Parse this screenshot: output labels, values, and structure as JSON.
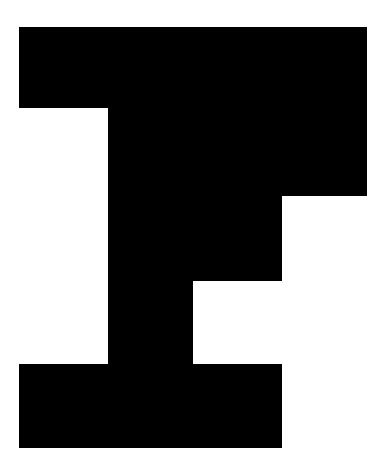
{
  "image": {
    "kind": "letterform-glyph",
    "description": "Bold slab-serif capital letter glyph rendered as a solid black silhouette on a plain white background",
    "character": "F",
    "alt_text": "Large black capital letter F",
    "width": 389,
    "height": 473
  },
  "colors": {
    "background": "#ffffff",
    "glyph": "#000000",
    "counter": "#ffffff"
  },
  "glyph": {
    "name": "capital-f",
    "label": "F",
    "fill": "#000000",
    "outline_path": "M 19 27 L 367 27 L 367 196 L 282 196 L 282 281 L 193 281 L 193 364 L 282 364 L 282 448 L 19 448 L 19 364 L 108 364 L 108 108 L 19 108 Z",
    "subshapes": [
      {
        "name": "top-bar",
        "role": "upper horizontal arm",
        "x": 19,
        "y": 27,
        "width": 348,
        "height": 81
      },
      {
        "name": "top-right-block",
        "role": "upper-right terminal block below top bar",
        "x": 281,
        "y": 108,
        "width": 86,
        "height": 88
      },
      {
        "name": "stem",
        "role": "vertical stroke",
        "x": 108,
        "y": 27,
        "width": 85,
        "height": 337
      },
      {
        "name": "middle-arm",
        "role": "middle horizontal arm",
        "x": 193,
        "y": 196,
        "width": 89,
        "height": 85
      },
      {
        "name": "bottom-bar",
        "role": "lower horizontal foot serif",
        "x": 19,
        "y": 364,
        "width": 263,
        "height": 84
      }
    ],
    "counters": [
      {
        "name": "upper-counter",
        "role": "enclosed white square notch between stem and top-right block",
        "x": 193,
        "y": 108,
        "width": 88,
        "height": 88,
        "fill": "#ffffff"
      },
      {
        "name": "lower-counter",
        "role": "open white notch right of stem below middle arm",
        "x": 193,
        "y": 281,
        "width": 89,
        "height": 83,
        "fill": "#ffffff"
      }
    ]
  }
}
